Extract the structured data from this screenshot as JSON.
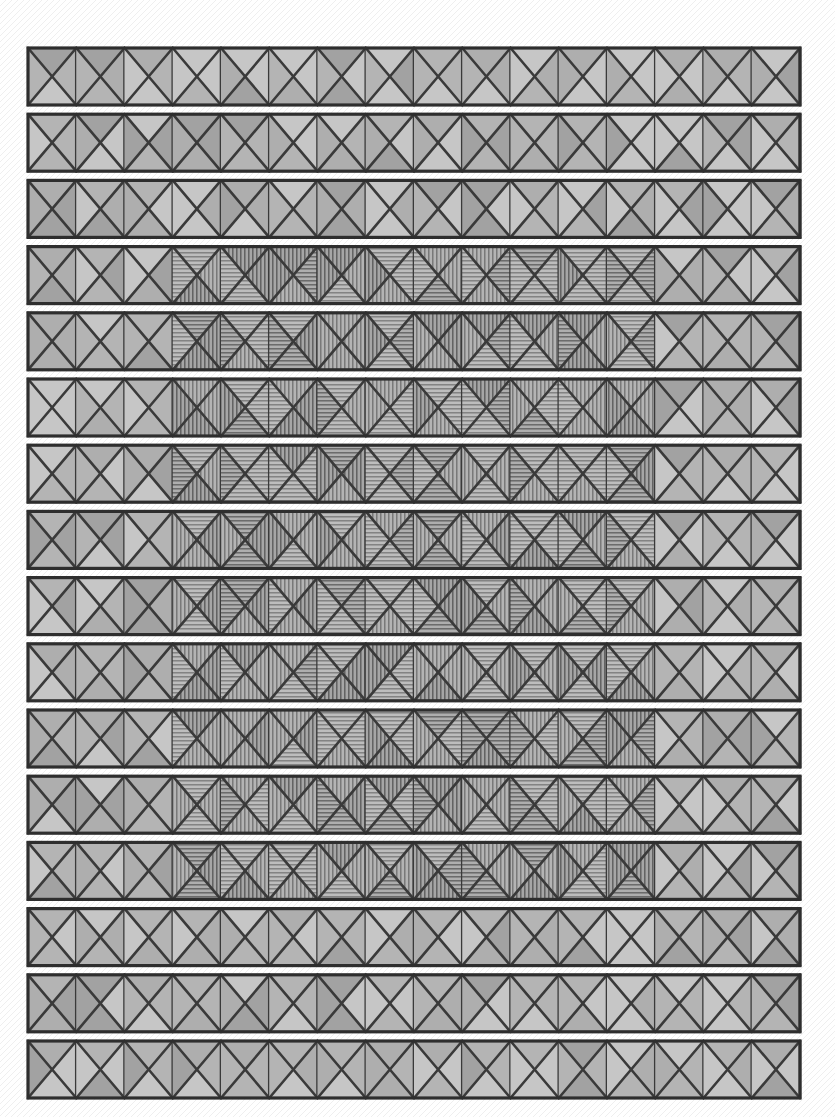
{
  "figure": {
    "canvas": {
      "width": 835,
      "height": 1117
    },
    "background_color": "#fefefe"
  },
  "geometry": {
    "band_left": 28,
    "band_right": 800,
    "band_width": 772,
    "first_band_top": 48,
    "band_height": 57,
    "band_pitch": 66.2,
    "band_count": 16,
    "cells_per_band": 16,
    "cell_width": 48.25
  },
  "style": {
    "panel_fill": "#b4b4b4",
    "panel_fill_alt": "#bdbdbd",
    "triangle_dark": "#a2a2a2",
    "triangle_light": "#c6c6c6",
    "stroke_color": "#3a3a3a",
    "stroke_width": 2.6,
    "outline_color": "#2e2e2e",
    "outline_width": 3.2,
    "hatch_color": "#4a4a4a",
    "hatch_spacing": 4,
    "hatch_opacity": 0.62
  },
  "damage_region": {
    "label": "hatched-core",
    "x_start": 200,
    "x_end": 640,
    "first_row_index": 3,
    "last_row_index": 12,
    "row_count": 10,
    "hatch_orientations": [
      "vertical",
      "horizontal"
    ]
  },
  "bands": [
    {
      "index": 0,
      "row_label": "row-1",
      "hatched": false,
      "shade_seed": 11
    },
    {
      "index": 1,
      "row_label": "row-2",
      "hatched": false,
      "shade_seed": 27
    },
    {
      "index": 2,
      "row_label": "row-3",
      "hatched": false,
      "shade_seed": 43
    },
    {
      "index": 3,
      "row_label": "row-4",
      "hatched": true,
      "shade_seed": 59
    },
    {
      "index": 4,
      "row_label": "row-5",
      "hatched": true,
      "shade_seed": 71
    },
    {
      "index": 5,
      "row_label": "row-6",
      "hatched": true,
      "shade_seed": 83
    },
    {
      "index": 6,
      "row_label": "row-7",
      "hatched": true,
      "shade_seed": 97
    },
    {
      "index": 7,
      "row_label": "row-8",
      "hatched": true,
      "shade_seed": 113
    },
    {
      "index": 8,
      "row_label": "row-9",
      "hatched": true,
      "shade_seed": 131
    },
    {
      "index": 9,
      "row_label": "row-10",
      "hatched": true,
      "shade_seed": 149
    },
    {
      "index": 10,
      "row_label": "row-11",
      "hatched": true,
      "shade_seed": 163
    },
    {
      "index": 11,
      "row_label": "row-12",
      "hatched": true,
      "shade_seed": 179
    },
    {
      "index": 12,
      "row_label": "row-13",
      "hatched": true,
      "shade_seed": 191
    },
    {
      "index": 13,
      "row_label": "row-14",
      "hatched": false,
      "shade_seed": 211
    },
    {
      "index": 14,
      "row_label": "row-15",
      "hatched": false,
      "shade_seed": 227
    },
    {
      "index": 15,
      "row_label": "row-16",
      "hatched": false,
      "shade_seed": 241
    }
  ]
}
